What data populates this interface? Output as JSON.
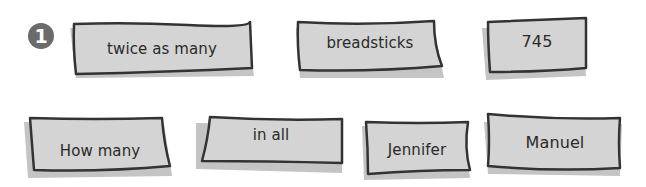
{
  "problem": {
    "number": "1"
  },
  "colors": {
    "card_fill": "#d4d4d4",
    "card_stroke": "#333333",
    "shadow": "#c2c2c2",
    "badge": "#6b6b6b"
  },
  "cards": [
    {
      "label": "twice as many"
    },
    {
      "label": "breadsticks"
    },
    {
      "label": "745"
    },
    {
      "label": "How many"
    },
    {
      "label": "in all"
    },
    {
      "label": "Jennifer"
    },
    {
      "label": "Manuel"
    }
  ]
}
